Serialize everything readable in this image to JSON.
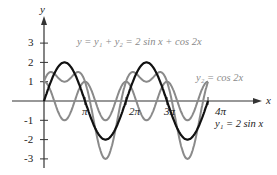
{
  "chart_data": {
    "type": "line",
    "title": "",
    "xlabel": "x",
    "ylabel": "y",
    "xlim": [
      0,
      12.566
    ],
    "ylim": [
      -3,
      3
    ],
    "x_ticks": [
      "π",
      "2π",
      "3π",
      "4π"
    ],
    "y_ticks": [
      "3",
      "2",
      "1",
      "-1",
      "-2",
      "-3"
    ],
    "grid": false,
    "series": [
      {
        "name": "y1 = 2 sin x",
        "formula": "2*sin(x)",
        "color": "#111111",
        "label_text": "y₁ = 2 sin x"
      },
      {
        "name": "y2 = cos 2x",
        "formula": "cos(2*x)",
        "color": "#8a8a8a",
        "label_text": "y₂ = cos 2x"
      },
      {
        "name": "y = y1 + y2 = 2 sin x + cos 2x",
        "formula": "2*sin(x)+cos(2*x)",
        "color": "#8a8a8a",
        "label_text": "y = y₁ + y₂ = 2 sin x + cos 2x"
      }
    ],
    "annotations": {
      "sum_label": "y = y₁ + y₂ = 2 sin x + cos 2x",
      "y2_label": "y₂ = cos 2x",
      "y1_label": "y₁ = 2 sin x"
    }
  }
}
